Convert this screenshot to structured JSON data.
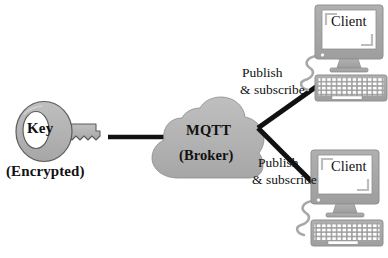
{
  "diagram": {
    "background_color": "#ffffff",
    "shape_fill_color": "#b3b3b3",
    "shape_stroke_color": "#555555",
    "device_color": "#a8a8a8",
    "line_color": "#111111",
    "text_color": "#111111"
  },
  "key_node": {
    "label": "Key",
    "sublabel": "(Encrypted)",
    "icon": "key-icon"
  },
  "broker_node": {
    "label": "MQTT",
    "sublabel": "(Broker)",
    "icon": "cloud-icon"
  },
  "connections": [
    {
      "id": "key-to-broker",
      "from": "key_node",
      "to": "broker_node",
      "style": "solid-thick",
      "label": ""
    },
    {
      "id": "broker-to-client-top",
      "from": "broker_node",
      "to": "client_top",
      "style": "solid-thick",
      "label_line1": "Publish",
      "label_line2": "& subscribe"
    },
    {
      "id": "broker-to-client-bottom",
      "from": "broker_node",
      "to": "client_bottom",
      "style": "solid-thick",
      "label_line1": "Publish",
      "label_line2": "& subscribe"
    }
  ],
  "client_top": {
    "label": "Client",
    "icon": "desktop-computer-icon",
    "parts": [
      "monitor",
      "monitor-stand",
      "keyboard",
      "cable"
    ]
  },
  "client_bottom": {
    "label": "Client",
    "icon": "desktop-computer-icon",
    "parts": [
      "monitor",
      "monitor-stand",
      "keyboard",
      "cable"
    ]
  },
  "edge_labels": {
    "publish": "Publish",
    "subscribe": "& subscribe"
  }
}
